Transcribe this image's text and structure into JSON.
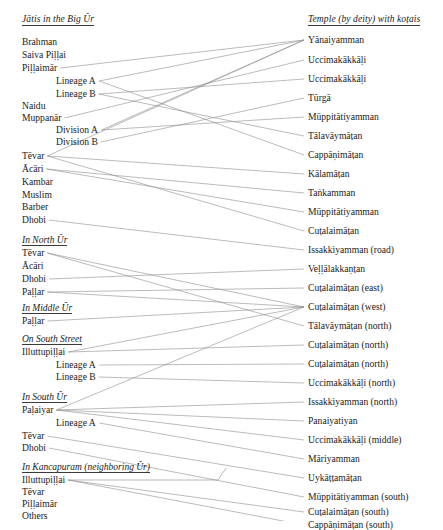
{
  "figure": {
    "type": "bipartite-network-diagram",
    "left_column_header": "Jātis in the Big Ŭr",
    "right_column_header": "Temple (by deity) with koṭais",
    "line_color": "#8d8d8d",
    "text_color": "#1a1a1a",
    "background": "#ffffff"
  },
  "left": {
    "header": "Jātis in the Big Ŭr",
    "groups": [
      {
        "id": "big-ur",
        "heading": null,
        "items": [
          {
            "id": "L1",
            "label": "Brahman",
            "indent": 0,
            "y": 37
          },
          {
            "id": "L2",
            "label": "Saiva Piḷḷai",
            "indent": 0,
            "y": 50
          },
          {
            "id": "L3",
            "label": "Piḷḷaimār",
            "indent": 0,
            "y": 63
          },
          {
            "id": "L4",
            "label": "Lineage A",
            "indent": 1,
            "y": 76
          },
          {
            "id": "L5",
            "label": "Lineage B",
            "indent": 1,
            "y": 89
          },
          {
            "id": "L6",
            "label": "Naidu",
            "indent": 0,
            "y": 101
          },
          {
            "id": "L7",
            "label": "Muppanār",
            "indent": 0,
            "y": 113
          },
          {
            "id": "L8",
            "label": "Division A",
            "indent": 1,
            "y": 125
          },
          {
            "id": "L9",
            "label": "Division B",
            "indent": 1,
            "y": 137
          },
          {
            "id": "L10",
            "label": "Tēvar",
            "indent": 0,
            "y": 151
          },
          {
            "id": "L11",
            "label": "Ācāri",
            "indent": 0,
            "y": 164
          },
          {
            "id": "L12",
            "label": "Kambar",
            "indent": 0,
            "y": 177
          },
          {
            "id": "L13",
            "label": "Muslim",
            "indent": 0,
            "y": 190
          },
          {
            "id": "L14",
            "label": "Barber",
            "indent": 0,
            "y": 202
          },
          {
            "id": "L15",
            "label": "Dhobi",
            "indent": 0,
            "y": 215
          }
        ]
      },
      {
        "id": "north-ur",
        "heading": "In North Ŭr",
        "heading_y": 235,
        "items": [
          {
            "id": "L16",
            "label": "Tēvar",
            "indent": 0,
            "y": 248
          },
          {
            "id": "L17",
            "label": "Ācāri",
            "indent": 0,
            "y": 261
          },
          {
            "id": "L18",
            "label": "Dhobi",
            "indent": 0,
            "y": 274
          },
          {
            "id": "L19",
            "label": "Paḷḷar",
            "indent": 0,
            "y": 287
          }
        ]
      },
      {
        "id": "middle-ur",
        "heading": "In Middle Ŭr",
        "heading_y": 303,
        "items": [
          {
            "id": "L20",
            "label": "Paḷḷar",
            "indent": 0,
            "y": 316
          }
        ]
      },
      {
        "id": "south-street",
        "heading": "On South Street",
        "heading_y": 334,
        "items": [
          {
            "id": "L21",
            "label": "Illuttupiḷḷai",
            "indent": 0,
            "y": 347
          },
          {
            "id": "L22",
            "label": "Lineage A",
            "indent": 1,
            "y": 360
          },
          {
            "id": "L23",
            "label": "Lineage B",
            "indent": 1,
            "y": 372
          }
        ]
      },
      {
        "id": "south-ur",
        "heading": "In South Ŭr",
        "heading_y": 392,
        "items": [
          {
            "id": "L24",
            "label": "Paḷaiyar",
            "indent": 0,
            "y": 405
          },
          {
            "id": "L25",
            "label": "Lineage A",
            "indent": 1,
            "y": 418
          },
          {
            "id": "L26",
            "label": "Tēvar",
            "indent": 0,
            "y": 431
          },
          {
            "id": "L27",
            "label": "Dhobi",
            "indent": 0,
            "y": 443
          }
        ]
      },
      {
        "id": "kancapuram",
        "heading": "In Kancapuram (neighboring Ŭr)",
        "heading_y": 462,
        "items": [
          {
            "id": "L28",
            "label": "Illuttupiḷḷai",
            "indent": 0,
            "y": 475
          },
          {
            "id": "L29",
            "label": "Tēvar",
            "indent": 0,
            "y": 487
          },
          {
            "id": "L30",
            "label": "Piḷḷaimār",
            "indent": 0,
            "y": 499
          },
          {
            "id": "L31",
            "label": "Others",
            "indent": 0,
            "y": 511
          }
        ]
      }
    ]
  },
  "right": {
    "header": "Temple (by deity) with koṭais",
    "items": [
      {
        "id": "R1",
        "label": "Yānaiyamman",
        "y": 35
      },
      {
        "id": "R2",
        "label": "Uccimakākkāḷi",
        "y": 55
      },
      {
        "id": "R3",
        "label": "Uccimakākkāḷi",
        "y": 74
      },
      {
        "id": "R4",
        "label": "Tūrgā",
        "y": 93
      },
      {
        "id": "R5",
        "label": "Mūppitātiyamman",
        "y": 112
      },
      {
        "id": "R6",
        "label": "Tālavāymāṭan",
        "y": 131
      },
      {
        "id": "R7",
        "label": "Cappāṇimāṭan",
        "y": 150
      },
      {
        "id": "R8",
        "label": "Kālamāṭan",
        "y": 169
      },
      {
        "id": "R9",
        "label": "Taṅkamman",
        "y": 188
      },
      {
        "id": "R10",
        "label": "Mūppitātiyamman",
        "y": 207
      },
      {
        "id": "R11",
        "label": "Cuṭalaimāṭan",
        "y": 226
      },
      {
        "id": "R12",
        "label": "Issakkiyamman (road)",
        "y": 245
      },
      {
        "id": "R13",
        "label": "Veḷḷālakkaṇṭan",
        "y": 264
      },
      {
        "id": "R14",
        "label": "Cuṭalaimāṭan (east)",
        "y": 283
      },
      {
        "id": "R15",
        "label": "Cuṭalaimāṭan (west)",
        "y": 302
      },
      {
        "id": "R16",
        "label": "Tālavāymāṭan (north)",
        "y": 321
      },
      {
        "id": "R17",
        "label": "Cuṭalaimāṭan (north)",
        "y": 340
      },
      {
        "id": "R18",
        "label": "Cuṭalaimāṭan (north)",
        "y": 359
      },
      {
        "id": "R19",
        "label": "Uccimakākkāḷi (north)",
        "y": 378
      },
      {
        "id": "R20",
        "label": "Issakkiyamman (north)",
        "y": 397
      },
      {
        "id": "R21",
        "label": "Panaiyatiyan",
        "y": 416
      },
      {
        "id": "R22",
        "label": "Uccimakākkāḷi (middle)",
        "y": 435
      },
      {
        "id": "R23",
        "label": "Māriyamman",
        "y": 454
      },
      {
        "id": "R24",
        "label": "Uykāṭṭamāṭan",
        "y": 473
      },
      {
        "id": "R25",
        "label": "Mūppitātiyamman (south)",
        "y": 492
      },
      {
        "id": "R26",
        "label": "Cuṭalaimāṭan (south)",
        "y": 507
      },
      {
        "id": "R27",
        "label": "Cappāṇimāṭan (south)",
        "y": 520
      }
    ]
  },
  "links": [
    {
      "from": "L3",
      "to": "R1"
    },
    {
      "from": "L4",
      "to": "R1"
    },
    {
      "from": "L4",
      "to": "R7"
    },
    {
      "from": "L5",
      "to": "R3"
    },
    {
      "from": "L5",
      "to": "R6"
    },
    {
      "from": "L7",
      "to": "R2"
    },
    {
      "from": "L8",
      "to": "R1"
    },
    {
      "from": "L8",
      "to": "R5"
    },
    {
      "from": "L9",
      "to": "R4"
    },
    {
      "from": "L10",
      "to": "R1"
    },
    {
      "from": "L10",
      "to": "R8"
    },
    {
      "from": "L10",
      "to": "R11"
    },
    {
      "from": "L11",
      "to": "R9"
    },
    {
      "from": "L11",
      "to": "R10"
    },
    {
      "from": "L15",
      "to": "R12"
    },
    {
      "from": "L16",
      "to": "R15"
    },
    {
      "from": "L16",
      "to": "R16"
    },
    {
      "from": "L18",
      "to": "R13"
    },
    {
      "from": "L19",
      "to": "R14"
    },
    {
      "from": "L19",
      "to": "R15"
    },
    {
      "from": "L20",
      "to": "R15"
    },
    {
      "from": "L21",
      "to": "R15"
    },
    {
      "from": "L21",
      "to": "R17"
    },
    {
      "from": "L22",
      "to": "R18"
    },
    {
      "from": "L23",
      "to": "R19"
    },
    {
      "from": "L24",
      "to": "R15"
    },
    {
      "from": "L24",
      "to": "R20"
    },
    {
      "from": "L24",
      "to": "R21"
    },
    {
      "from": "L24",
      "to": "R22"
    },
    {
      "from": "L25",
      "to": "R23"
    },
    {
      "from": "L26",
      "to": "R24"
    },
    {
      "from": "L27",
      "to": "R25"
    },
    {
      "from": "L28",
      "to": "R26"
    },
    {
      "from": "L28",
      "to": "R27"
    }
  ]
}
